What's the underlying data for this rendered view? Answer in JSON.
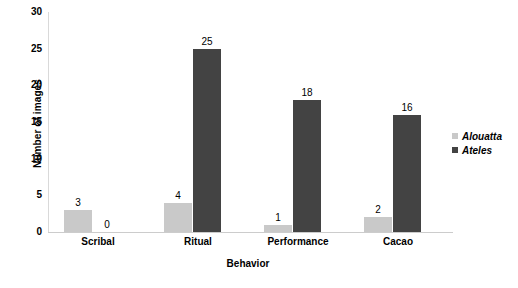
{
  "chart_data": {
    "type": "bar",
    "title": "",
    "xlabel": "Behavior",
    "ylabel": "Number of images",
    "categories": [
      "Scribal",
      "Ritual",
      "Performance",
      "Cacao"
    ],
    "series": [
      {
        "name": "Alouatta",
        "color": "#c9c9c9",
        "values": [
          3,
          4,
          1,
          2
        ]
      },
      {
        "name": "Ateles",
        "color": "#434343",
        "values": [
          0,
          25,
          18,
          16
        ]
      }
    ],
    "ylim": [
      0,
      30
    ],
    "yticks": [
      0,
      5,
      10,
      15,
      20,
      25,
      30
    ],
    "ytick_labels": [
      "0",
      "5",
      "10",
      "15",
      "20",
      "25",
      "30"
    ],
    "grid": false,
    "legend_position": "right",
    "data_labels": true
  }
}
